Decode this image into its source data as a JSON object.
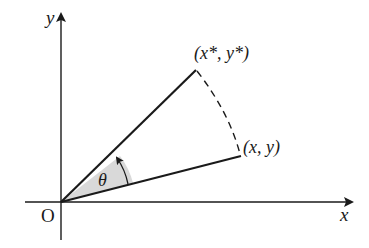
{
  "diagram": {
    "type": "rotation-of-point",
    "axes": {
      "x_label": "x",
      "y_label": "y",
      "origin_label": "O"
    },
    "points": {
      "original": {
        "label": "(x, y)"
      },
      "rotated": {
        "label": "(x*, y*)"
      }
    },
    "angle": {
      "label": "θ"
    },
    "colors": {
      "line": "#1a1a1a",
      "wedge_fill": "#d9d9d9",
      "background": "#ffffff"
    }
  }
}
